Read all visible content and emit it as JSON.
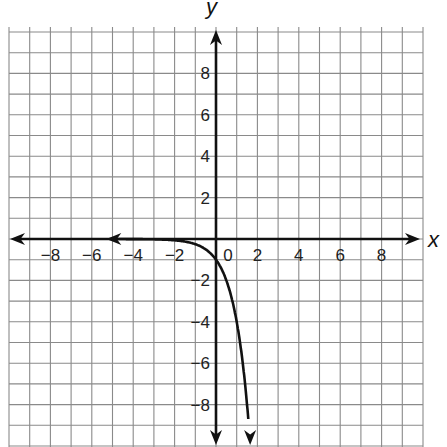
{
  "chart_data": {
    "type": "line",
    "title": "",
    "xlabel": "x",
    "ylabel": "y",
    "xlim": [
      -10,
      10
    ],
    "ylim": [
      -10,
      10
    ],
    "grid": true,
    "grid_step": 1,
    "x_tick_labels": [
      "-8",
      "-6",
      "-4",
      "-2",
      "0",
      "2",
      "4",
      "6",
      "8"
    ],
    "x_tick_values": [
      -8,
      -6,
      -4,
      -2,
      0,
      2,
      4,
      6,
      8
    ],
    "y_tick_labels": [
      "8",
      "6",
      "4",
      "2",
      "-2",
      "-4",
      "-6",
      "-8"
    ],
    "y_tick_values": [
      8,
      6,
      4,
      2,
      -2,
      -4,
      -6,
      -8
    ],
    "series": [
      {
        "name": "curve",
        "function": "y = -4^x",
        "x": [
          -5,
          -4,
          -3,
          -2,
          -1.5,
          -1,
          -0.5,
          0,
          0.5,
          1,
          1.25,
          1.5,
          1.6
        ],
        "y": [
          -0.001,
          -0.004,
          -0.016,
          -0.06,
          -0.13,
          -0.25,
          -0.5,
          -1,
          -2,
          -4,
          -5.66,
          -8,
          -9.19
        ],
        "arrows": [
          "left-end near x=-5 along asymptote y=0",
          "bottom-end near x=1.6"
        ]
      }
    ],
    "asymptote": "y = 0",
    "y_intercept": -1,
    "colors": {
      "grid": "#8a8a8a",
      "axis": "#111111",
      "curve": "#111111"
    }
  }
}
